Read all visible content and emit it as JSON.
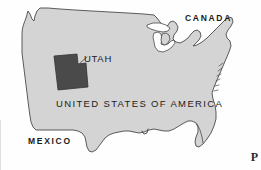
{
  "figure": {
    "kind": "locator-map",
    "width": 261,
    "height": 170,
    "background_color": "#fefefe"
  },
  "colors": {
    "country_fill": "#d4d4d4",
    "country_outline": "#4b4b4b",
    "highlight_fill": "#4a4a4a",
    "highlight_outline": "#333333",
    "label_text": "#1b1b1b",
    "leader_line": "#555555"
  },
  "labels": {
    "canada": "CANADA",
    "mexico": "MEXICO",
    "country": "UNITED STATES OF AMERICA",
    "highlight_state": "UTAH"
  },
  "corner": {
    "mark": "P"
  },
  "geometry": {
    "usa_outline": "M 20,31 L 22,24 L 25,19 L 27,14 L 29,12 L 31,16 L 33,20 L 35,17 L 37,13 L 40,10 L 45,9 L 52,9 L 62,10 L 74,11 L 88,12 L 104,13 L 120,14 L 136,15 L 150,16 L 158,19 L 162,23 L 166,27 L 170,28 L 172,25 L 175,23 L 178,25 L 180,29 L 178,33 L 176,37 L 178,41 L 182,43 L 186,42 L 190,39 L 193,35 L 196,32 L 199,30 L 202,31 L 204,34 L 203,38 L 200,41 L 197,44 L 200,43 L 204,41 L 208,38 L 212,34 L 216,30 L 220,26 L 224,22 L 227,19 L 230,17 L 233,18 L 234,22 L 232,26 L 229,30 L 227,34 L 228,38 L 230,41 L 231,45 L 230,49 L 228,53 L 226,57 L 224,61 L 222,65 L 220,69 L 218,73 L 216,77 L 214,81 L 212,85 L 210,89 L 209,93 L 210,97 L 212,101 L 214,105 L 215,110 L 215,115 L 214,121 L 212,127 L 209,133 L 206,138 L 203,142 L 200,145 L 197,146 L 195,144 L 194,140 L 195,136 L 197,132 L 198,128 L 197,124 L 195,121 L 192,119 L 188,119 L 184,121 L 180,124 L 176,127 L 172,129 L 168,130 L 164,130 L 160,129 L 156,128 L 152,128 L 148,129 L 144,131 L 140,132 L 136,132 L 132,131 L 128,130 L 124,130 L 120,131 L 116,132 L 112,133 L 108,134 L 104,136 L 101,139 L 99,143 L 97,147 L 94,150 L 91,152 L 88,152 L 86,149 L 85,145 L 84,140 L 82,136 L 79,133 L 76,131 L 72,130 L 68,130 L 64,130 L 60,130 L 56,130 L 52,130 L 48,130 L 44,130 L 40,130 L 36,130 L 33,128 L 31,124 L 30,120 L 29,115 L 28,110 L 27,105 L 26,100 L 25,95 L 24,90 L 23,85 L 22,80 L 21,75 L 20,70 L 19,65 L 18,60 L 18,55 L 18,50 L 19,45 L 19,40 L 20,35 Z",
    "utah_outline": "M 54,57 L 76,55 L 77,64 L 85,63 L 87,86 L 57,89 Z",
    "leader_line": {
      "x1": 80,
      "y1": 63,
      "x2": 86,
      "y2": 57
    }
  },
  "features": {
    "great_lakes": "Great Lakes basin with Michigan peninsula",
    "florida": "Florida peninsula",
    "texas": "Texas and the Gulf coast",
    "puget_sound": "Pacific Northwest coastal notch",
    "new_england": "New England and Maine coastline"
  }
}
